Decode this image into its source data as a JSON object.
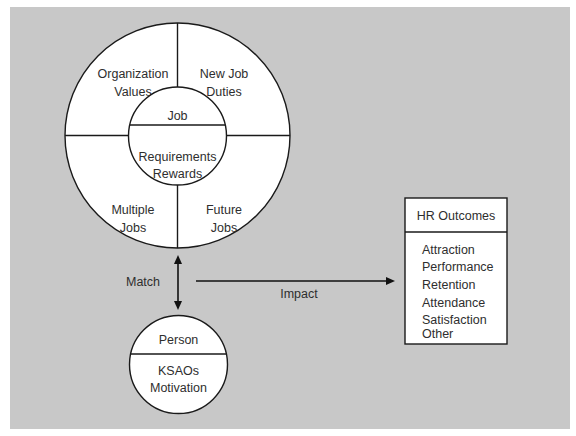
{
  "diagram": {
    "colors": {
      "background": "#c8c8c8",
      "shape_fill": "#ffffff",
      "stroke": "#1a1a1a",
      "text": "#2e2e2e"
    },
    "job_circle": {
      "center_label": "Job",
      "center_details": [
        "Requirements",
        "Rewards"
      ],
      "quadrants": {
        "top_left": [
          "Organization",
          "Values"
        ],
        "top_right": [
          "New Job",
          "Duties"
        ],
        "bottom_left": [
          "Multiple",
          "Jobs"
        ],
        "bottom_right": [
          "Future",
          "Jobs"
        ]
      }
    },
    "match_arrow": {
      "label": "Match",
      "direction": "bidirectional"
    },
    "person_circle": {
      "label": "Person",
      "details": [
        "KSAOs",
        "Motivation"
      ]
    },
    "impact_arrow": {
      "label": "Impact"
    },
    "hr_outcomes_box": {
      "title": "HR Outcomes",
      "items": [
        "Attraction",
        "Performance",
        "Retention",
        "Attendance",
        "Satisfaction",
        "Other"
      ]
    }
  }
}
